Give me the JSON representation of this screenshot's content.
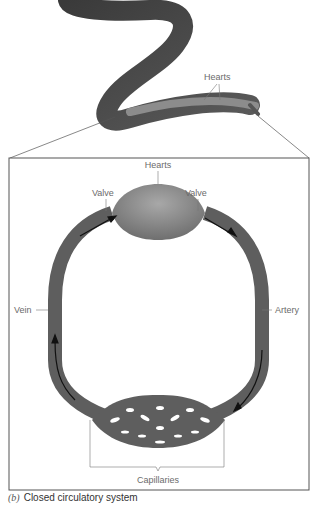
{
  "figure": {
    "caption_letter": "(b)",
    "caption_text": "Closed circulatory system"
  },
  "labels": {
    "worm_hearts": "Hearts",
    "hearts": "Hearts",
    "valve_left": "Valve",
    "valve_right": "Valve",
    "vein": "Vein",
    "artery": "Artery",
    "capillaries": "Capillaries"
  },
  "colors": {
    "vessel": "#5e5e5e",
    "heart": "#8a8a8a",
    "worm": "#4a4a4a",
    "label": "#6b6b6b",
    "frame": "#555555"
  }
}
